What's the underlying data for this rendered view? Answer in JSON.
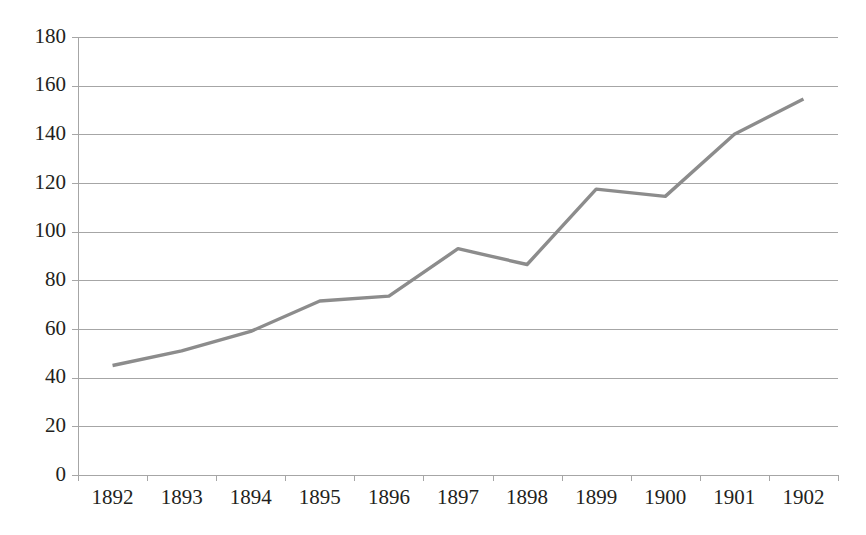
{
  "chart_data": {
    "type": "line",
    "title": "",
    "subtitle": "",
    "xlabel": "",
    "ylabel": "",
    "categories": [
      "1892",
      "1893",
      "1894",
      "1895",
      "1896",
      "1897",
      "1898",
      "1899",
      "1900",
      "1901",
      "1902"
    ],
    "values": [
      45,
      51,
      59,
      71.5,
      73.5,
      93,
      86.5,
      117.5,
      114.5,
      140,
      154.5
    ],
    "series": [
      {
        "name": "",
        "values": [
          45,
          51,
          59,
          71.5,
          73.5,
          93,
          86.5,
          117.5,
          114.5,
          140,
          154.5
        ],
        "color": "#8c8c8c"
      }
    ],
    "ylim": [
      0,
      180
    ],
    "yticks": [
      0,
      20,
      40,
      60,
      80,
      100,
      120,
      140,
      160,
      180
    ],
    "ytick_labels": [
      "0",
      "20",
      "40",
      "60",
      "80",
      "100",
      "120",
      "140",
      "160",
      "180"
    ],
    "xtick_labels": [
      "1892",
      "1893",
      "1894",
      "1895",
      "1896",
      "1897",
      "1898",
      "1899",
      "1900",
      "1901",
      "1902"
    ],
    "grid": true,
    "grid_axis": "y",
    "legend": false,
    "legend_position": "none",
    "markers": false,
    "annotations": []
  },
  "style": {
    "background": "#ffffff",
    "line_color": "#8c8c8c",
    "grid_color": "#a6a6a6",
    "axis_color": "#a6a6a6",
    "text_color": "#231f20"
  },
  "plot_geometry": {
    "left": 78,
    "right": 838,
    "top": 37,
    "bottom": 475
  }
}
